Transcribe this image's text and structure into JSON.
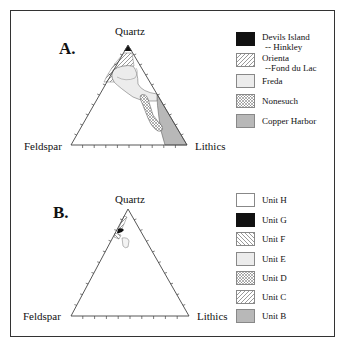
{
  "panel_a": {
    "label": "A.",
    "apex_label": "Quartz",
    "left_label": "Feldspar",
    "right_label": "Lithics",
    "legend": [
      {
        "name": "Devils Island",
        "sub": "-- Hinkley",
        "fill": "solid-black",
        "color": "#111111"
      },
      {
        "name": "Orienta",
        "sub": "--Fond du Lac",
        "fill": "diagonal-hatch",
        "color": "#ffffff"
      },
      {
        "name": "Freda",
        "sub": "",
        "fill": "light-gray",
        "color": "#ececec"
      },
      {
        "name": "Nonesuch",
        "sub": "",
        "fill": "crosshatch",
        "color": "#ffffff"
      },
      {
        "name": "Copper Harbor",
        "sub": "",
        "fill": "gray",
        "color": "#b8b8b8"
      }
    ]
  },
  "panel_b": {
    "label": "B.",
    "apex_label": "Quartz",
    "left_label": "Feldspar",
    "right_label": "Lithics",
    "legend": [
      {
        "name": "Unit H",
        "fill": "white",
        "color": "#ffffff"
      },
      {
        "name": "Unit G",
        "fill": "solid-black",
        "color": "#111111"
      },
      {
        "name": "Unit F",
        "fill": "back-diagonal-hatch",
        "color": "#ffffff"
      },
      {
        "name": "Unit E",
        "fill": "light-gray",
        "color": "#ececec"
      },
      {
        "name": "Unit D",
        "fill": "crosshatch",
        "color": "#ffffff"
      },
      {
        "name": "Unit C",
        "fill": "diagonal-hatch",
        "color": "#ffffff"
      },
      {
        "name": "Unit B",
        "fill": "gray",
        "color": "#b8b8b8"
      }
    ]
  }
}
